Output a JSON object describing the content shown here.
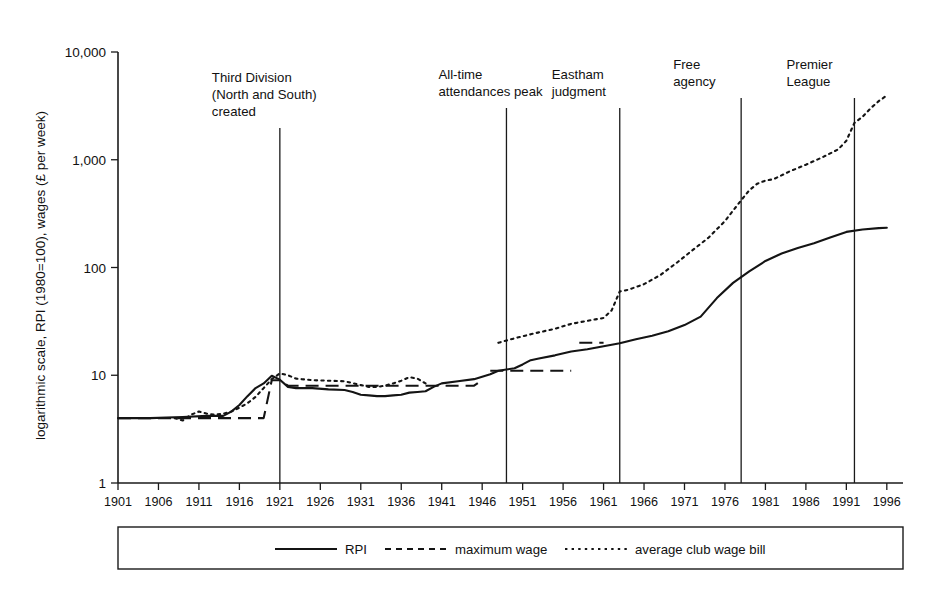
{
  "chart_data": {
    "type": "line",
    "title": "",
    "xlabel": "",
    "ylabel": "logarithmic scale, RPI (1980=100), wages (£ per week)",
    "log_y": true,
    "ylim": [
      1,
      10000
    ],
    "xlim": [
      1901,
      1998
    ],
    "grid": false,
    "legend_position": "bottom",
    "ytick_labels": [
      "10,000",
      "1,000",
      "100",
      "10",
      "1"
    ],
    "ytick_values": [
      10000,
      1000,
      100,
      10,
      1
    ],
    "xtick_labels": [
      "1901",
      "1906",
      "1911",
      "1916",
      "1921",
      "1926",
      "1931",
      "1936",
      "1941",
      "1946",
      "1951",
      "1956",
      "1961",
      "1966",
      "1971",
      "1976",
      "1981",
      "1986",
      "1991",
      "1996"
    ],
    "xtick_values": [
      1901,
      1906,
      1911,
      1916,
      1921,
      1926,
      1931,
      1936,
      1941,
      1946,
      1951,
      1956,
      1961,
      1966,
      1971,
      1976,
      1981,
      1986,
      1991,
      1996
    ],
    "series": [
      {
        "name": "RPI",
        "style": "solid",
        "x": [
          1901,
          1905,
          1909,
          1912,
          1914,
          1915,
          1916,
          1917,
          1918,
          1919,
          1920,
          1921,
          1922,
          1923,
          1925,
          1927,
          1929,
          1930,
          1931,
          1932,
          1933,
          1934,
          1935,
          1936,
          1937,
          1938,
          1939,
          1940,
          1941,
          1943,
          1945,
          1947,
          1948,
          1949,
          1950,
          1951,
          1952,
          1953,
          1955,
          1957,
          1959,
          1961,
          1963,
          1965,
          1967,
          1969,
          1971,
          1973,
          1975,
          1977,
          1979,
          1981,
          1983,
          1985,
          1987,
          1989,
          1991,
          1993,
          1995,
          1996
        ],
        "y": [
          4.0,
          4.0,
          4.1,
          4.2,
          4.2,
          4.6,
          5.3,
          6.4,
          7.6,
          8.4,
          9.9,
          9.1,
          7.8,
          7.6,
          7.6,
          7.4,
          7.3,
          7.0,
          6.6,
          6.5,
          6.4,
          6.4,
          6.5,
          6.6,
          6.9,
          7.0,
          7.1,
          7.8,
          8.4,
          8.8,
          9.2,
          10.2,
          11.0,
          11.3,
          11.6,
          12.6,
          13.8,
          14.3,
          15.3,
          16.6,
          17.4,
          18.6,
          19.8,
          21.6,
          23.3,
          25.6,
          29.2,
          35.0,
          52.0,
          72.0,
          92.0,
          115.0,
          135.0,
          152.0,
          168.0,
          190.0,
          214.0,
          225.0,
          232.0,
          234.0
        ]
      },
      {
        "name": "maximum wage",
        "style": "dashed",
        "segments": [
          {
            "x": [
              1901,
              1910,
              1915,
              1918,
              1919,
              1920,
              1921,
              1922,
              1923,
              1930,
              1938,
              1939,
              1945,
              1946
            ],
            "y": [
              4.0,
              4.0,
              4.0,
              4.0,
              4.0,
              9.0,
              9.0,
              8.0,
              8.0,
              8.0,
              8.0,
              8.0,
              8.0,
              9.0
            ]
          },
          {
            "x": [
              1947,
              1949,
              1951,
              1953,
              1955,
              1957
            ],
            "y": [
              11.0,
              11.0,
              11.0,
              11.0,
              11.0,
              11.0
            ]
          },
          {
            "x": [
              1958,
              1960,
              1961
            ],
            "y": [
              20.0,
              20.0,
              20.0
            ]
          }
        ]
      },
      {
        "name": "average club wage bill",
        "style": "dotted",
        "segments": [
          {
            "x": [
              1908,
              1909,
              1910,
              1911,
              1912,
              1913,
              1914,
              1915,
              1916,
              1917,
              1918,
              1919,
              1920,
              1921,
              1922,
              1923,
              1925,
              1927,
              1929,
              1931,
              1932,
              1933,
              1934,
              1935,
              1936,
              1937,
              1938,
              1939
            ],
            "y": [
              4.0,
              3.8,
              4.3,
              4.6,
              4.4,
              4.3,
              4.4,
              4.6,
              5.0,
              5.5,
              6.3,
              7.6,
              9.2,
              10.4,
              10.0,
              9.3,
              9.0,
              8.9,
              8.8,
              8.1,
              7.8,
              7.8,
              8.0,
              8.4,
              8.9,
              9.6,
              9.3,
              8.4
            ]
          },
          {
            "x": [
              1948,
              1949,
              1950,
              1951,
              1952,
              1953,
              1955,
              1957,
              1958,
              1959,
              1960,
              1961,
              1962,
              1963,
              1964,
              1966,
              1968,
              1970,
              1972,
              1974,
              1976,
              1978,
              1979,
              1980,
              1981,
              1982,
              1984,
              1986,
              1988,
              1990,
              1991,
              1992,
              1993,
              1994,
              1995,
              1996
            ],
            "y": [
              20.0,
              21.0,
              22.0,
              23.0,
              24.0,
              25.0,
              27.0,
              30.0,
              31.0,
              32.0,
              33.0,
              34.0,
              40.0,
              60.0,
              62.0,
              70.0,
              85.0,
              110.0,
              145.0,
              190.0,
              270.0,
              420.0,
              520.0,
              600.0,
              640.0,
              660.0,
              780.0,
              900.0,
              1050.0,
              1250.0,
              1500.0,
              2200.0,
              2500.0,
              3000.0,
              3500.0,
              3950.0
            ]
          }
        ]
      }
    ],
    "event_lines": [
      {
        "year": 1921,
        "label_lines": [
          "Third Division",
          "(North and South)",
          "created"
        ]
      },
      {
        "year": 1949,
        "label_lines": [
          "All-time",
          "attendances peak"
        ]
      },
      {
        "year": 1963,
        "label_lines": [
          "Eastham",
          "judgment"
        ]
      },
      {
        "year": 1978,
        "label_lines": [
          "Free",
          "agency"
        ]
      },
      {
        "year": 1992,
        "label_lines": [
          "Premier",
          "League"
        ]
      }
    ],
    "legend_entries": [
      {
        "label": "RPI",
        "style": "solid"
      },
      {
        "label": "maximum wage",
        "style": "dashed"
      },
      {
        "label": "average club wage bill",
        "style": "dotted"
      }
    ]
  }
}
